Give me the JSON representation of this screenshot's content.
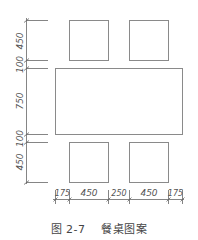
{
  "diagram": {
    "title": "餐桌图案",
    "figure_number": "图 2-7",
    "line_color": "#8a8a8a",
    "dim_color": "#555555",
    "elements": {
      "table": {
        "label": "table",
        "width_mm": 1150,
        "depth_mm": 750
      },
      "chairs": [
        {
          "label": "chair-top-left",
          "size_mm": 450
        },
        {
          "label": "chair-top-right",
          "size_mm": 450
        },
        {
          "label": "chair-bottom-left",
          "size_mm": 450
        },
        {
          "label": "chair-bottom-right",
          "size_mm": 450
        }
      ]
    },
    "vertical_dimensions": [
      "450",
      "100",
      "750",
      "100",
      "450"
    ],
    "horizontal_dimensions": [
      "175",
      "450",
      "250",
      "450",
      "175"
    ]
  }
}
